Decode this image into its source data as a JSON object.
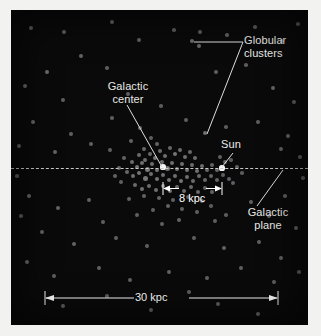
{
  "figure": {
    "type": "scatter-diagram",
    "background_color": "#0a0a0b",
    "dot_color": "#8e8e90",
    "highlight_color": "#f4f4f2",
    "label_color": "#e9e9e6"
  },
  "labels": {
    "globular_clusters": "Globular\nclusters",
    "galactic_center": "Galactic\ncenter",
    "sun": "Sun",
    "galactic_plane": "Galactic\nplane"
  },
  "scales": {
    "inner": "8 kpc",
    "outer": "30 kpc"
  },
  "chart_data": {
    "type": "scatter",
    "title": "",
    "xlabel": "",
    "ylabel": "",
    "legend": [],
    "annotations": [
      {
        "text": "Globular clusters",
        "points_to": [
          [
            181,
            31
          ],
          [
            194,
            123
          ]
        ]
      },
      {
        "text": "Galactic center",
        "points_to": [
          [
            152,
            157
          ]
        ]
      },
      {
        "text": "Sun",
        "points_to": [
          [
            211,
            158
          ]
        ]
      },
      {
        "text": "Galactic plane",
        "points_to": [
          [
            248,
            158
          ]
        ]
      }
    ],
    "scale_bars": [
      {
        "label": "8 kpc",
        "x0": 152,
        "x1": 211,
        "y": 178
      },
      {
        "label": "30 kpc",
        "x0": 34,
        "x1": 267,
        "y": 288
      }
    ],
    "reference_line": {
      "orientation": "horizontal",
      "y": 158,
      "style": "dashed",
      "name": "Galactic plane"
    },
    "special_points": [
      {
        "name": "galactic-center",
        "x": 152,
        "y": 157,
        "r": 2.6
      },
      {
        "name": "sun",
        "x": 211,
        "y": 158,
        "r": 2.6
      }
    ],
    "points": [
      [
        20,
        18,
        1.9
      ],
      [
        53,
        22,
        1.9
      ],
      [
        101,
        12,
        2.0
      ],
      [
        128,
        30,
        1.9
      ],
      [
        163,
        20,
        1.8
      ],
      [
        189,
        22,
        1.9
      ],
      [
        216,
        25,
        2.0
      ],
      [
        244,
        17,
        1.8
      ],
      [
        271,
        31,
        2.0
      ],
      [
        287,
        14,
        1.8
      ],
      [
        70,
        46,
        2.0
      ],
      [
        36,
        62,
        2.2
      ],
      [
        181,
        31,
        2.2
      ],
      [
        188,
        36,
        2.1
      ],
      [
        14,
        76,
        2.0
      ],
      [
        52,
        90,
        1.9
      ],
      [
        96,
        58,
        1.8
      ],
      [
        117,
        84,
        1.9
      ],
      [
        205,
        62,
        1.9
      ],
      [
        235,
        55,
        1.8
      ],
      [
        262,
        78,
        2.0
      ],
      [
        283,
        92,
        1.9
      ],
      [
        150,
        96,
        1.8
      ],
      [
        175,
        110,
        1.9
      ],
      [
        22,
        112,
        2.0
      ],
      [
        60,
        124,
        1.9
      ],
      [
        101,
        108,
        1.8
      ],
      [
        129,
        118,
        2.0
      ],
      [
        194,
        123,
        2.3
      ],
      [
        215,
        117,
        1.8
      ],
      [
        247,
        112,
        1.9
      ],
      [
        277,
        126,
        2.0
      ],
      [
        8,
        136,
        1.9
      ],
      [
        44,
        142,
        2.0
      ],
      [
        80,
        134,
        1.9
      ],
      [
        270,
        139,
        1.9
      ],
      [
        289,
        147,
        1.8
      ],
      [
        99,
        140,
        1.9
      ],
      [
        120,
        131,
        2.0
      ],
      [
        133,
        139,
        2.1
      ],
      [
        140,
        128,
        1.9
      ],
      [
        146,
        134,
        2.0
      ],
      [
        128,
        145,
        2.2
      ],
      [
        134,
        150,
        2.3
      ],
      [
        139,
        144,
        2.1
      ],
      [
        144,
        148,
        2.4
      ],
      [
        149,
        141,
        2.2
      ],
      [
        154,
        146,
        2.3
      ],
      [
        159,
        138,
        2.1
      ],
      [
        164,
        144,
        2.4
      ],
      [
        169,
        140,
        2.2
      ],
      [
        174,
        147,
        2.3
      ],
      [
        179,
        142,
        2.1
      ],
      [
        184,
        148,
        2.2
      ],
      [
        121,
        152,
        2.2
      ],
      [
        126,
        157,
        2.4
      ],
      [
        131,
        153,
        2.3
      ],
      [
        136,
        159,
        2.5
      ],
      [
        141,
        154,
        2.3
      ],
      [
        146,
        160,
        2.4
      ],
      [
        151,
        152,
        2.2
      ],
      [
        156,
        158,
        2.5
      ],
      [
        161,
        153,
        2.3
      ],
      [
        166,
        159,
        2.4
      ],
      [
        171,
        154,
        2.3
      ],
      [
        176,
        160,
        2.4
      ],
      [
        181,
        155,
        2.2
      ],
      [
        186,
        161,
        2.3
      ],
      [
        191,
        156,
        2.2
      ],
      [
        196,
        160,
        2.1
      ],
      [
        201,
        155,
        2.0
      ],
      [
        206,
        160,
        2.1
      ],
      [
        116,
        162,
        2.1
      ],
      [
        122,
        166,
        2.3
      ],
      [
        128,
        163,
        2.4
      ],
      [
        134,
        168,
        2.5
      ],
      [
        140,
        164,
        2.3
      ],
      [
        146,
        169,
        2.4
      ],
      [
        152,
        165,
        2.3
      ],
      [
        158,
        170,
        2.4
      ],
      [
        164,
        166,
        2.3
      ],
      [
        170,
        171,
        2.4
      ],
      [
        176,
        167,
        2.3
      ],
      [
        182,
        171,
        2.2
      ],
      [
        188,
        166,
        2.2
      ],
      [
        194,
        170,
        2.1
      ],
      [
        200,
        166,
        2.0
      ],
      [
        206,
        170,
        2.0
      ],
      [
        212,
        165,
        1.9
      ],
      [
        218,
        169,
        1.9
      ],
      [
        124,
        175,
        2.2
      ],
      [
        131,
        179,
        2.3
      ],
      [
        138,
        176,
        2.2
      ],
      [
        145,
        180,
        2.3
      ],
      [
        152,
        176,
        2.2
      ],
      [
        159,
        181,
        2.3
      ],
      [
        166,
        177,
        2.2
      ],
      [
        173,
        181,
        2.2
      ],
      [
        180,
        177,
        2.1
      ],
      [
        187,
        182,
        2.1
      ],
      [
        194,
        178,
        2.0
      ],
      [
        201,
        182,
        2.0
      ],
      [
        113,
        148,
        2.0
      ],
      [
        108,
        158,
        2.1
      ],
      [
        104,
        166,
        2.0
      ],
      [
        110,
        172,
        1.9
      ],
      [
        209,
        147,
        1.9
      ],
      [
        214,
        152,
        1.9
      ],
      [
        220,
        150,
        1.8
      ],
      [
        226,
        157,
        1.9
      ],
      [
        231,
        163,
        1.8
      ],
      [
        222,
        173,
        1.9
      ],
      [
        133,
        186,
        2.0
      ],
      [
        148,
        188,
        2.0
      ],
      [
        162,
        190,
        1.9
      ],
      [
        177,
        187,
        1.9
      ],
      [
        191,
        191,
        1.9
      ],
      [
        118,
        189,
        1.9
      ],
      [
        157,
        196,
        2.0
      ],
      [
        171,
        199,
        1.9
      ],
      [
        142,
        200,
        1.9
      ],
      [
        186,
        202,
        1.9
      ],
      [
        200,
        196,
        1.8
      ],
      [
        126,
        205,
        1.9
      ],
      [
        168,
        210,
        2.0
      ],
      [
        151,
        214,
        1.9
      ],
      [
        204,
        211,
        1.9
      ],
      [
        215,
        205,
        1.8
      ],
      [
        18,
        186,
        2.0
      ],
      [
        47,
        198,
        2.0
      ],
      [
        78,
        190,
        1.9
      ],
      [
        92,
        212,
        1.9
      ],
      [
        31,
        222,
        1.9
      ],
      [
        63,
        234,
        2.0
      ],
      [
        105,
        228,
        1.9
      ],
      [
        136,
        236,
        1.9
      ],
      [
        183,
        228,
        1.9
      ],
      [
        213,
        238,
        2.0
      ],
      [
        240,
        192,
        1.9
      ],
      [
        258,
        206,
        1.9
      ],
      [
        274,
        186,
        1.8
      ],
      [
        285,
        218,
        1.9
      ],
      [
        248,
        232,
        1.9
      ],
      [
        270,
        248,
        1.9
      ],
      [
        16,
        252,
        2.0
      ],
      [
        43,
        266,
        1.9
      ],
      [
        88,
        258,
        1.9
      ],
      [
        119,
        270,
        1.9
      ],
      [
        158,
        262,
        1.9
      ],
      [
        196,
        268,
        1.9
      ],
      [
        230,
        258,
        1.9
      ],
      [
        263,
        272,
        1.9
      ],
      [
        52,
        296,
        1.9
      ],
      [
        140,
        300,
        1.9
      ],
      [
        207,
        294,
        1.9
      ],
      [
        247,
        304,
        2.0
      ],
      [
        96,
        286,
        1.8
      ],
      [
        178,
        282,
        1.8
      ],
      [
        288,
        262,
        1.8
      ],
      [
        10,
        206,
        1.8
      ],
      [
        292,
        168,
        1.8
      ],
      [
        6,
        166,
        1.8
      ]
    ]
  }
}
